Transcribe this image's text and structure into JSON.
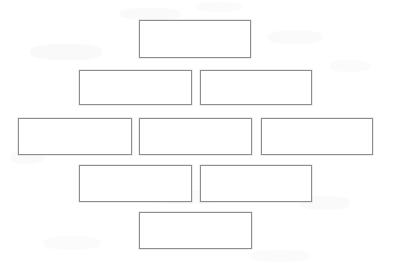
{
  "page": {
    "width": 394,
    "height": 268,
    "background_color": "#ffffff"
  },
  "style": {
    "box_fill": "#ffffff",
    "box_border_color": "#8e8e8e",
    "box_border_width": 1,
    "artifact_color": "#f2f2f2"
  },
  "diagram": {
    "type": "blank-boxes",
    "row_count": 5,
    "box_count": 9,
    "rows": [
      {
        "row_name": "row-1",
        "box_count": 1,
        "boxes": [
          {
            "id": "box-1-1",
            "label": "",
            "x": 139,
            "y": 20,
            "w": 112,
            "h": 38
          }
        ]
      },
      {
        "row_name": "row-2",
        "box_count": 2,
        "boxes": [
          {
            "id": "box-2-1",
            "label": "",
            "x": 79,
            "y": 70,
            "w": 113,
            "h": 35
          },
          {
            "id": "box-2-2",
            "label": "",
            "x": 200,
            "y": 70,
            "w": 112,
            "h": 35
          }
        ]
      },
      {
        "row_name": "row-3",
        "box_count": 3,
        "boxes": [
          {
            "id": "box-3-1",
            "label": "",
            "x": 18,
            "y": 118,
            "w": 114,
            "h": 37
          },
          {
            "id": "box-3-2",
            "label": "",
            "x": 139,
            "y": 118,
            "w": 113,
            "h": 37
          },
          {
            "id": "box-3-3",
            "label": "",
            "x": 261,
            "y": 118,
            "w": 112,
            "h": 37
          }
        ]
      },
      {
        "row_name": "row-4",
        "box_count": 2,
        "boxes": [
          {
            "id": "box-4-1",
            "label": "",
            "x": 79,
            "y": 165,
            "w": 113,
            "h": 37
          },
          {
            "id": "box-4-2",
            "label": "",
            "x": 200,
            "y": 165,
            "w": 112,
            "h": 37
          }
        ]
      },
      {
        "row_name": "row-5",
        "box_count": 1,
        "boxes": [
          {
            "id": "box-5-1",
            "label": "",
            "x": 139,
            "y": 212,
            "w": 113,
            "h": 37
          }
        ]
      }
    ]
  },
  "artifacts": [
    {
      "x": 30,
      "y": 44,
      "w": 72,
      "h": 16,
      "color": "#f4f4f4"
    },
    {
      "x": 120,
      "y": 8,
      "w": 60,
      "h": 12,
      "color": "#f6f6f6"
    },
    {
      "x": 196,
      "y": 2,
      "w": 46,
      "h": 10,
      "color": "#f7f7f7"
    },
    {
      "x": 268,
      "y": 30,
      "w": 54,
      "h": 14,
      "color": "#f6f6f6"
    },
    {
      "x": 330,
      "y": 60,
      "w": 40,
      "h": 12,
      "color": "#f7f7f7"
    },
    {
      "x": 10,
      "y": 150,
      "w": 34,
      "h": 14,
      "color": "#f6f6f6"
    },
    {
      "x": 150,
      "y": 190,
      "w": 70,
      "h": 14,
      "color": "#f7f7f7"
    },
    {
      "x": 300,
      "y": 196,
      "w": 50,
      "h": 14,
      "color": "#f6f6f6"
    },
    {
      "x": 44,
      "y": 236,
      "w": 56,
      "h": 14,
      "color": "#f7f7f7"
    },
    {
      "x": 250,
      "y": 250,
      "w": 60,
      "h": 12,
      "color": "#f7f7f7"
    }
  ]
}
